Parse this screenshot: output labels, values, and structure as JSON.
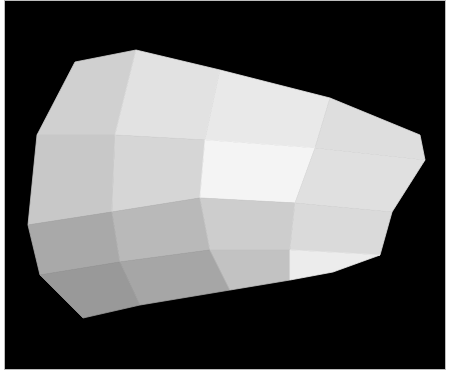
{
  "figure": {
    "background_color": "#000000",
    "border_color": "#bdbdbd",
    "mesh": {
      "rows": [
        [
          [
            75,
            62
          ],
          [
            136,
            50
          ],
          [
            220,
            70
          ],
          [
            330,
            98
          ],
          [
            420,
            135
          ]
        ],
        [
          [
            37,
            135
          ],
          [
            115,
            135
          ],
          [
            205,
            140
          ],
          [
            315,
            148
          ],
          [
            425,
            160
          ]
        ],
        [
          [
            28,
            225
          ],
          [
            112,
            212
          ],
          [
            200,
            198
          ],
          [
            295,
            203
          ],
          [
            392,
            212
          ]
        ],
        [
          [
            40,
            275
          ],
          [
            120,
            262
          ],
          [
            210,
            250
          ],
          [
            290,
            250
          ],
          [
            380,
            255
          ]
        ],
        [
          [
            83,
            318
          ],
          [
            140,
            305
          ],
          [
            230,
            290
          ],
          [
            290,
            280
          ],
          [
            333,
            272
          ]
        ]
      ],
      "shades": [
        [
          "#d0d0d0",
          "#e2e2e2",
          "#e9e9e9",
          "#dedede"
        ],
        [
          "#c8c8c8",
          "#d6d6d6",
          "#f4f4f4",
          "#e0e0e0"
        ],
        [
          "#a9a9a9",
          "#b9b9b9",
          "#cdcdcd",
          "#dadada"
        ],
        [
          "#999999",
          "#a6a6a6",
          "#c2c2c2",
          "#ececec"
        ]
      ]
    }
  }
}
